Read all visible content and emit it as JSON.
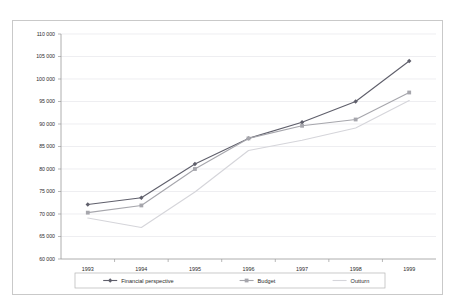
{
  "chart_data": {
    "type": "line",
    "title": "",
    "subtitle": "",
    "xlabel": "",
    "ylabel": "",
    "categories": [
      "1993",
      "1994",
      "1995",
      "1996",
      "1997",
      "1998",
      "1999"
    ],
    "x": [
      1993,
      1994,
      1995,
      1996,
      1997,
      1998,
      1999
    ],
    "ylim": [
      60000,
      110000
    ],
    "ytick_values": [
      60000,
      65000,
      70000,
      75000,
      80000,
      85000,
      90000,
      95000,
      100000,
      105000,
      110000
    ],
    "ytick_labels": [
      "60 000",
      "65 000",
      "70 000",
      "75 000",
      "80 000",
      "85 000",
      "90 000",
      "95 000",
      "100 000",
      "105 000",
      "110 000"
    ],
    "xtick_labels": [
      "1993",
      "1994",
      "1995",
      "1996",
      "1997",
      "1998",
      "1999"
    ],
    "grid": true,
    "grid_axis": "y",
    "legend_position": "bottom",
    "series": [
      {
        "name": "Financial perspective",
        "marker": "diamond",
        "color": "#5f5f6b",
        "values": [
          72100,
          73600,
          81100,
          86800,
          90400,
          95000,
          104000
        ]
      },
      {
        "name": "Budget",
        "marker": "square",
        "color": "#a6a6ac",
        "values": [
          70300,
          71900,
          80000,
          86800,
          89600,
          91000,
          97000
        ]
      },
      {
        "name": "Outturn",
        "marker": "none",
        "color": "#d5d5da",
        "values": [
          69100,
          67000,
          74900,
          84100,
          86400,
          89100,
          95200
        ]
      }
    ]
  },
  "legend": {
    "items": [
      {
        "label": "Financial perspective",
        "marker": "diamond",
        "color": "#5f5f6b"
      },
      {
        "label": "Budget",
        "marker": "square",
        "color": "#a6a6ac"
      },
      {
        "label": "Outturn",
        "marker": "none",
        "color": "#d5d5da"
      }
    ]
  },
  "axis_labels": {
    "y_0": "110 000",
    "y_1": "105 000",
    "y_2": "100 000",
    "y_3": "95 000",
    "y_4": "90 000",
    "y_5": "85 000",
    "y_6": "80 000",
    "y_7": "75 000",
    "y_8": "70 000",
    "y_9": "65 000",
    "y_10": "60 000",
    "x_0": "1993",
    "x_1": "1994",
    "x_2": "1995",
    "x_3": "1996",
    "x_4": "1997",
    "x_5": "1998",
    "x_6": "1999"
  },
  "colors": {
    "financial_perspective": "#5f5f6b",
    "budget": "#a6a6ac",
    "outturn": "#d5d5da",
    "grid": "#e3e3e8",
    "axis": "#9a9a9a",
    "frame": "#c9c9c9",
    "background": "#ffffff"
  }
}
